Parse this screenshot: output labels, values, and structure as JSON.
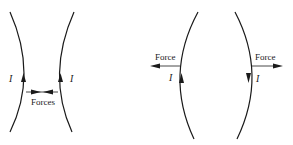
{
  "diagrams": [
    {
      "id": "parallel-currents",
      "current_label_left": "I",
      "current_label_right": "I",
      "force_label": "Forces",
      "current_directions": [
        "up",
        "up"
      ],
      "force_direction": "inward"
    },
    {
      "id": "antiparallel-currents",
      "current_label_left": "I",
      "current_label_right": "I",
      "force_label_left": "Force",
      "force_label_right": "Force",
      "current_directions": [
        "up",
        "down"
      ],
      "force_direction": "outward"
    }
  ],
  "colors": {
    "line": "#1a1a1a",
    "background": "#ffffff"
  }
}
